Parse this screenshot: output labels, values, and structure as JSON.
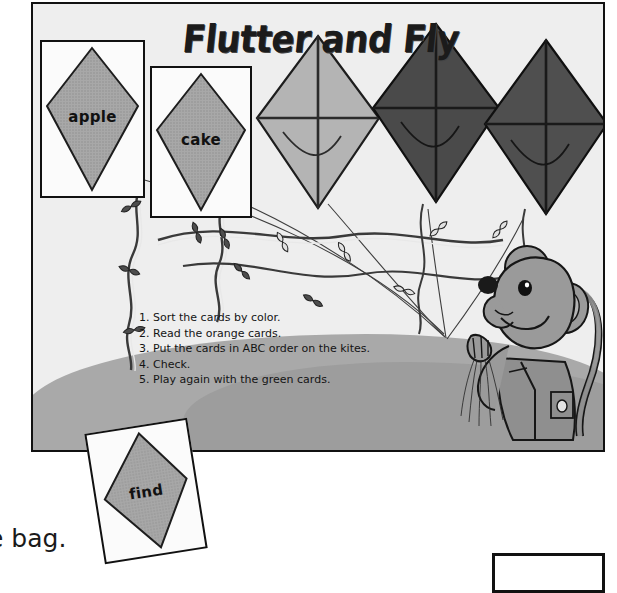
{
  "page": {
    "title": "Flutter and Fly",
    "stray_text": "e bag."
  },
  "instructions": [
    {
      "num": "1.",
      "text": "Sort the cards by color."
    },
    {
      "num": "2.",
      "text": "Read the orange cards."
    },
    {
      "num": "3.",
      "text": "Put the cards in ABC order on the kites."
    },
    {
      "num": "4.",
      "text": "Check."
    },
    {
      "num": "5.",
      "text": "Play again with the green cards."
    }
  ],
  "word_cards": [
    {
      "word": "apple"
    },
    {
      "word": "cake"
    },
    {
      "word": "find"
    }
  ],
  "kites": [
    {
      "name": "kite-apple-card",
      "shade": "#a8a8a8"
    },
    {
      "name": "kite-cake-card",
      "shade": "#a8a8a8"
    },
    {
      "name": "kite-light-gray",
      "shade": "#b4b4b4"
    },
    {
      "name": "kite-dark-gray-1",
      "shade": "#4a4a4a"
    },
    {
      "name": "kite-dark-gray-2",
      "shade": "#4f4f4f"
    },
    {
      "name": "kite-find-card",
      "shade": "#a8a8a8"
    }
  ],
  "character": {
    "name": "mouse",
    "body_color": "#9a9a9a"
  },
  "colors": {
    "sky": "#eeeeee",
    "ground": "#a9a9a9",
    "ink": "#111111",
    "card_face": "#fbfbfb"
  }
}
